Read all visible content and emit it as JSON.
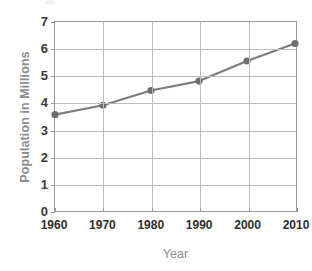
{
  "chart_data": {
    "type": "line",
    "title": "",
    "xlabel": "Year",
    "ylabel": "Population in Millions",
    "x": [
      1960,
      1970,
      1980,
      1990,
      2000,
      2010
    ],
    "categories": [
      "1960",
      "1970",
      "1980",
      "1990",
      "2000",
      "2010"
    ],
    "values": [
      3.55,
      3.9,
      4.45,
      4.8,
      5.55,
      6.2
    ],
    "series": [
      {
        "name": "Population",
        "values": [
          3.55,
          3.9,
          4.45,
          4.8,
          5.55,
          6.2
        ]
      }
    ],
    "xlim": [
      1960,
      2010
    ],
    "ylim": [
      0,
      7
    ],
    "yticks": [
      0,
      1,
      2,
      3,
      4,
      5,
      6,
      7
    ],
    "ytick_labels": [
      "0",
      "1",
      "2",
      "3",
      "4",
      "5",
      "6",
      "7"
    ],
    "xticks": [
      1960,
      1970,
      1980,
      1990,
      2000,
      2010
    ],
    "xtick_labels": [
      "1960",
      "1970",
      "1980",
      "1990",
      "2000",
      "2010"
    ],
    "grid": true,
    "legend": false,
    "legend_position": "none",
    "annotations": [],
    "colors": {
      "line": "#7d7d7d",
      "marker": "#6e6e6e",
      "grid": "#bcbcbc",
      "frame": "#9a9a9a",
      "axis_title": "#8c8c8c",
      "tick_label": "#2e2e2e",
      "background": "#ffffff"
    }
  }
}
